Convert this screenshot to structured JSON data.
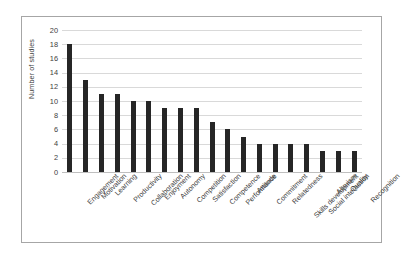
{
  "chart_data": {
    "type": "bar",
    "title": "",
    "xlabel": "",
    "ylabel": "Number of studies",
    "ylim": [
      0,
      20
    ],
    "ytick_step": 2,
    "yticks": [
      20,
      18,
      16,
      14,
      12,
      10,
      8,
      6,
      4,
      2,
      0
    ],
    "grid": true,
    "legend": "none",
    "bar_color": "#262626",
    "grid_color": "#d9d9d9",
    "axis_color": "#bfbfbf",
    "border_color": "#a6a6a6",
    "background": "#ffffff",
    "categories": [
      "Engagement",
      "Motivation",
      "Learning",
      "Productivity",
      "Collaboration",
      "Enjoyment",
      "Autonomy",
      "Competition",
      "Satisfaction",
      "Competence",
      "Performance",
      "Attitude",
      "Commitment",
      "Relatedness",
      "Skills development",
      "Social interaction",
      "Altruism",
      "Quality",
      "Recognition"
    ],
    "values": [
      18,
      13,
      11,
      11,
      10,
      10,
      9,
      9,
      9,
      7,
      6,
      5,
      4,
      4,
      4,
      4,
      3,
      3,
      3
    ]
  }
}
